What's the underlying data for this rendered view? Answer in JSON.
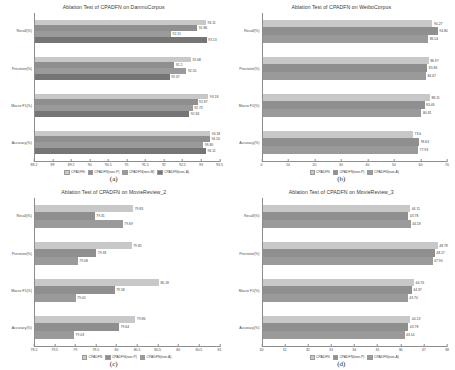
{
  "figure": {
    "panels": [
      {
        "letter": "(a)",
        "title": "Ablation Test of CPADFN on DanmuCorpus",
        "xticks": [
          "88.2",
          "89",
          "89.2",
          "90",
          "90.5",
          "91",
          "91.5",
          "92",
          "92.5",
          "93",
          "93.5"
        ],
        "legend": [
          "CPADFN",
          "CPADFN(non-P)",
          "CPADFN(non-M)",
          "CPADFN(non-A)"
        ],
        "categories": [
          "Recall(%)",
          "Precision(%)",
          "Macro F1(%)",
          "Accuracy(%)"
        ],
        "values": [
          [
            "93.11",
            "92.86",
            "92.11",
            "93.13"
          ],
          [
            "92.68",
            "92.2",
            "92.55",
            "92.07"
          ],
          [
            "93.18",
            "92.87",
            "92.73",
            "92.63"
          ],
          [
            "94.18",
            "94.16",
            "93.80",
            "93.11"
          ]
        ]
      },
      {
        "letter": "(b)",
        "title": "Ablation Test of CPADFN on WeiboCorpus",
        "xticks": [
          "0",
          "10",
          "20",
          "30",
          "40",
          "50",
          "60",
          "70"
        ],
        "legend": [
          "CPADFN",
          "CPADFN(non-P)",
          "CPADFN(non-A)"
        ],
        "categories": [
          "Recall(%)",
          "Precision(%)",
          "Macro F1(%)",
          "Accuracy(%)"
        ],
        "values": [
          [
            "90.27",
            "94.80",
            "86.54"
          ],
          [
            "86.97",
            "85.86",
            "84.67"
          ],
          [
            "88.11",
            "83.46",
            "80.81"
          ],
          [
            "73.6",
            "78.63",
            "77.93"
          ]
        ]
      },
      {
        "letter": "(c)",
        "title": "Ablation Test of CPADFN on MovieReview_2",
        "xticks": [
          "78.5",
          "79.5",
          "79",
          "79.5",
          "80",
          "80.5",
          "80.5",
          "80",
          "80.5",
          "81"
        ],
        "legend": [
          "CPADFN",
          "CPADFN(non-P)",
          "CPADFN(non-A)"
        ],
        "categories": [
          "Recall(%)",
          "Precision(%)",
          "Macro F1(%)",
          "Accuracy(%)"
        ],
        "values": [
          [
            "79.83",
            "79.31",
            "79.69"
          ],
          [
            "79.81",
            "79.33",
            "79.08"
          ],
          [
            "80.18",
            "79.58",
            "79.05"
          ],
          [
            "79.86",
            "79.64",
            "79.03"
          ]
        ]
      },
      {
        "letter": "(d)",
        "title": "Ablation Test of CPADFN on MovieReview_3",
        "xticks": [
          "30",
          "31",
          "32",
          "33",
          "34",
          "35",
          "36",
          "37",
          "38"
        ],
        "legend": [
          "CPADFN",
          "CPADFN(non-P)",
          "CPADFN(non-A)"
        ],
        "categories": [
          "Recall(%)",
          "Precision(%)",
          "Macro F1(%)",
          "Accuracy(%)"
        ],
        "values": [
          [
            "44.11",
            "43.78",
            "44.18"
          ],
          [
            "48.78",
            "48.27",
            "47.90"
          ],
          [
            "44.76",
            "44.37",
            "43.70"
          ],
          [
            "44.13",
            "43.78",
            "43.14"
          ]
        ]
      }
    ]
  },
  "chart_data": [
    {
      "type": "bar",
      "orientation": "horizontal",
      "title": "Ablation Test of CPADFN on DanmuCorpus",
      "xlabel": "",
      "ylabel": "",
      "grid": false,
      "legend_position": "bottom",
      "categories": [
        "Recall(%)",
        "Precision(%)",
        "Macro F1(%)",
        "Accuracy(%)"
      ],
      "xlim": [
        88.2,
        93.5
      ],
      "xticks": [
        88.2,
        89,
        89.2,
        90,
        90.5,
        91,
        91.5,
        92,
        92.5,
        93,
        93.5
      ],
      "series": [
        {
          "name": "CPADFN",
          "values": [
            93.11,
            92.68,
            93.18,
            94.18
          ]
        },
        {
          "name": "CPADFN(non-P)",
          "values": [
            92.86,
            92.2,
            92.87,
            94.16
          ]
        },
        {
          "name": "CPADFN(non-M)",
          "values": [
            92.11,
            92.55,
            92.73,
            93.8
          ]
        },
        {
          "name": "CPADFN(non-A)",
          "values": [
            93.13,
            92.07,
            92.63,
            93.11
          ]
        }
      ]
    },
    {
      "type": "bar",
      "orientation": "horizontal",
      "title": "Ablation Test of CPADFN on WeiboCorpus",
      "xlabel": "",
      "ylabel": "",
      "grid": false,
      "legend_position": "bottom",
      "categories": [
        "Recall(%)",
        "Precision(%)",
        "Macro F1(%)",
        "Accuracy(%)"
      ],
      "xlim": [
        0,
        70
      ],
      "xticks": [
        0,
        10,
        20,
        30,
        40,
        50,
        60,
        70
      ],
      "series": [
        {
          "name": "CPADFN",
          "values": [
            90.27,
            86.97,
            88.11,
            73.6
          ]
        },
        {
          "name": "CPADFN(non-P)",
          "values": [
            94.8,
            85.86,
            83.46,
            78.63
          ]
        },
        {
          "name": "CPADFN(non-A)",
          "values": [
            86.54,
            84.67,
            80.81,
            77.93
          ]
        }
      ]
    },
    {
      "type": "bar",
      "orientation": "horizontal",
      "title": "Ablation Test of CPADFN on MovieReview_2",
      "xlabel": "",
      "ylabel": "",
      "grid": false,
      "legend_position": "bottom",
      "categories": [
        "Recall(%)",
        "Precision(%)",
        "Macro F1(%)",
        "Accuracy(%)"
      ],
      "xlim": [
        78.5,
        81
      ],
      "xticks": [
        78.5,
        79,
        79.5,
        80,
        80.5,
        81
      ],
      "series": [
        {
          "name": "CPADFN",
          "values": [
            79.83,
            79.81,
            80.18,
            79.86
          ]
        },
        {
          "name": "CPADFN(non-P)",
          "values": [
            79.31,
            79.33,
            79.58,
            79.64
          ]
        },
        {
          "name": "CPADFN(non-A)",
          "values": [
            79.69,
            79.08,
            79.05,
            79.03
          ]
        }
      ]
    },
    {
      "type": "bar",
      "orientation": "horizontal",
      "title": "Ablation Test of CPADFN on MovieReview_3",
      "xlabel": "",
      "ylabel": "",
      "grid": false,
      "legend_position": "bottom",
      "categories": [
        "Recall(%)",
        "Precision(%)",
        "Macro F1(%)",
        "Accuracy(%)"
      ],
      "xlim": [
        30,
        38
      ],
      "xticks": [
        30,
        31,
        32,
        33,
        34,
        35,
        36,
        37,
        38
      ],
      "series": [
        {
          "name": "CPADFN",
          "values": [
            44.11,
            48.78,
            44.76,
            44.13
          ]
        },
        {
          "name": "CPADFN(non-P)",
          "values": [
            43.78,
            48.27,
            44.37,
            43.78
          ]
        },
        {
          "name": "CPADFN(non-A)",
          "values": [
            44.18,
            47.9,
            43.7,
            43.14
          ]
        }
      ]
    }
  ],
  "colors": {
    "series_1": "#c8c8c8",
    "series_2": "#8f8f8f",
    "series_3": "#9a9a9a",
    "series_4": "#757575",
    "axis": "#8d8d8d",
    "text": "#3f3f3f",
    "background": "#ffffff"
  }
}
